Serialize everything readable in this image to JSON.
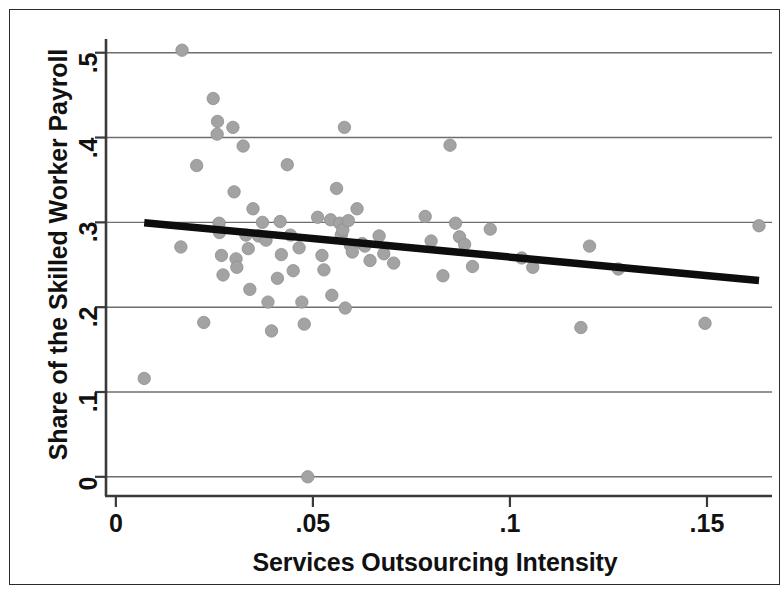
{
  "figure": {
    "background_color": "#ffffff",
    "frame_color": "#2b2b2b",
    "axis_color": "#3a3a3a",
    "gridline_color": "#6e6e6e",
    "marker_color": "#a3a3a3",
    "marker_edge_color": "#8e8e8e",
    "fit_line_color": "#0d0d0d"
  },
  "chart_data": {
    "type": "scatter",
    "title": "",
    "xlabel": "Services Outsourcing Intensity",
    "ylabel": "Share of the Skilled Worker Payroll",
    "xlim": [
      -0.0025,
      0.1665
    ],
    "ylim": [
      -0.012,
      0.515
    ],
    "xticks": [
      0,
      0.05,
      0.1,
      0.15
    ],
    "xticklabels": [
      "0",
      ".05",
      ".1",
      ".15"
    ],
    "yticks": [
      0,
      0.1,
      0.2,
      0.3,
      0.4,
      0.5
    ],
    "yticklabels": [
      "0",
      ".1",
      ".2",
      ".3",
      ".4",
      ".5"
    ],
    "grid": "horizontal",
    "legend": "none",
    "points": [
      [
        0.0072,
        0.116
      ],
      [
        0.0168,
        0.503
      ],
      [
        0.0165,
        0.271
      ],
      [
        0.0205,
        0.367
      ],
      [
        0.0223,
        0.182
      ],
      [
        0.0247,
        0.446
      ],
      [
        0.0258,
        0.419
      ],
      [
        0.0257,
        0.404
      ],
      [
        0.0262,
        0.299
      ],
      [
        0.0263,
        0.288
      ],
      [
        0.0268,
        0.261
      ],
      [
        0.0272,
        0.238
      ],
      [
        0.0297,
        0.412
      ],
      [
        0.03,
        0.336
      ],
      [
        0.0305,
        0.257
      ],
      [
        0.0307,
        0.247
      ],
      [
        0.0323,
        0.39
      ],
      [
        0.033,
        0.285
      ],
      [
        0.0336,
        0.269
      ],
      [
        0.034,
        0.221
      ],
      [
        0.0348,
        0.316
      ],
      [
        0.0362,
        0.284
      ],
      [
        0.0372,
        0.3
      ],
      [
        0.0381,
        0.279
      ],
      [
        0.0386,
        0.206
      ],
      [
        0.0395,
        0.172
      ],
      [
        0.041,
        0.234
      ],
      [
        0.0417,
        0.301
      ],
      [
        0.042,
        0.262
      ],
      [
        0.0435,
        0.368
      ],
      [
        0.0443,
        0.285
      ],
      [
        0.045,
        0.243
      ],
      [
        0.0465,
        0.27
      ],
      [
        0.0472,
        0.206
      ],
      [
        0.0478,
        0.18
      ],
      [
        0.0487,
        0.0
      ],
      [
        0.0512,
        0.306
      ],
      [
        0.0523,
        0.261
      ],
      [
        0.0528,
        0.244
      ],
      [
        0.0545,
        0.303
      ],
      [
        0.0548,
        0.214
      ],
      [
        0.056,
        0.34
      ],
      [
        0.0568,
        0.299
      ],
      [
        0.0572,
        0.285
      ],
      [
        0.0576,
        0.291
      ],
      [
        0.058,
        0.412
      ],
      [
        0.0582,
        0.199
      ],
      [
        0.059,
        0.302
      ],
      [
        0.0595,
        0.273
      ],
      [
        0.06,
        0.265
      ],
      [
        0.0612,
        0.316
      ],
      [
        0.0625,
        0.275
      ],
      [
        0.0632,
        0.272
      ],
      [
        0.0645,
        0.255
      ],
      [
        0.0668,
        0.284
      ],
      [
        0.068,
        0.263
      ],
      [
        0.0705,
        0.252
      ],
      [
        0.0785,
        0.307
      ],
      [
        0.08,
        0.278
      ],
      [
        0.083,
        0.237
      ],
      [
        0.0848,
        0.391
      ],
      [
        0.0862,
        0.299
      ],
      [
        0.0872,
        0.283
      ],
      [
        0.0885,
        0.274
      ],
      [
        0.0905,
        0.248
      ],
      [
        0.095,
        0.292
      ],
      [
        0.103,
        0.258
      ],
      [
        0.1058,
        0.247
      ],
      [
        0.118,
        0.176
      ],
      [
        0.1202,
        0.272
      ],
      [
        0.1275,
        0.245
      ],
      [
        0.1495,
        0.181
      ],
      [
        0.1632,
        0.296
      ]
    ],
    "fit_line": {
      "label": "linear fit",
      "x": [
        0.0072,
        0.1632
      ],
      "y": [
        0.2995,
        0.2315
      ]
    }
  }
}
